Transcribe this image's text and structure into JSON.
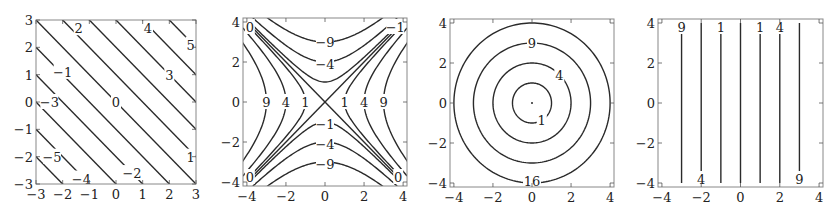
{
  "chart_data": [
    {
      "type": "contour",
      "id": "plot-1",
      "function": "x + y",
      "frame_px": [
        36,
        20,
        196,
        184
      ],
      "xlim": [
        -3,
        3
      ],
      "ylim": [
        -3,
        3
      ],
      "xticks": [
        -3,
        -2,
        -1,
        0,
        1,
        2,
        3
      ],
      "yticks": [
        -3,
        -2,
        -1,
        0,
        1,
        2,
        3
      ],
      "xtick_labels": [
        "−3",
        "−2",
        "−1",
        "0",
        "1",
        "2",
        "3"
      ],
      "ytick_labels": [
        "−3",
        "−2",
        "−1",
        "0",
        "1",
        "2",
        "3"
      ],
      "levels": [
        -5,
        -4,
        -3,
        -2,
        -1,
        0,
        1,
        2,
        3,
        4,
        5
      ],
      "contour_labels": [
        {
          "text": "2",
          "x": -1.4,
          "y": 2.7
        },
        {
          "text": "4",
          "x": 1.2,
          "y": 2.7
        },
        {
          "text": "5",
          "x": 2.8,
          "y": 2.1
        },
        {
          "text": "3",
          "x": 2.0,
          "y": 1.0
        },
        {
          "text": "−1",
          "x": -2.0,
          "y": 1.1
        },
        {
          "text": "−3",
          "x": -2.5,
          "y": 0.0
        },
        {
          "text": "0",
          "x": 0.0,
          "y": 0.0
        },
        {
          "text": "1",
          "x": 2.8,
          "y": -2.0
        },
        {
          "text": "−5",
          "x": -2.4,
          "y": -2.0
        },
        {
          "text": "−4",
          "x": -1.3,
          "y": -2.8
        },
        {
          "text": "−2",
          "x": 0.6,
          "y": -2.6
        }
      ],
      "grid": false
    },
    {
      "type": "contour",
      "id": "plot-2",
      "function": "x^2 - y^2",
      "frame_px": [
        243,
        18,
        407,
        186
      ],
      "xlim": [
        -4.2,
        4.2
      ],
      "ylim": [
        -4.2,
        4.2
      ],
      "xticks": [
        -4,
        -2,
        0,
        2,
        4
      ],
      "yticks": [
        -4,
        -2,
        0,
        2,
        4
      ],
      "xtick_labels": [
        "−4",
        "−2",
        "0",
        "2",
        "4"
      ],
      "ytick_labels": [
        "−4",
        "−2",
        "0",
        "2",
        "4"
      ],
      "levels": [
        -9,
        -4,
        -1,
        0,
        1,
        4,
        9
      ],
      "contour_labels": [
        {
          "text": "0",
          "x": -3.85,
          "y": 3.75
        },
        {
          "text": "−1",
          "x": 3.6,
          "y": 3.75
        },
        {
          "text": "−9",
          "x": 0.0,
          "y": 3.0
        },
        {
          "text": "−4",
          "x": 0.0,
          "y": 1.9
        },
        {
          "text": "9",
          "x": -3.0,
          "y": 0.0
        },
        {
          "text": "4",
          "x": -2.0,
          "y": 0.0
        },
        {
          "text": "1",
          "x": -1.0,
          "y": 0.0
        },
        {
          "text": "1",
          "x": 1.0,
          "y": 0.0
        },
        {
          "text": "4",
          "x": 2.0,
          "y": 0.0
        },
        {
          "text": "9",
          "x": 3.0,
          "y": 0.0
        },
        {
          "text": "−1",
          "x": 0.0,
          "y": -1.1
        },
        {
          "text": "−4",
          "x": 0.0,
          "y": -2.1
        },
        {
          "text": "−9",
          "x": 0.0,
          "y": -3.1
        },
        {
          "text": "0",
          "x": -3.85,
          "y": -3.75
        },
        {
          "text": "0",
          "x": 3.75,
          "y": -3.75
        }
      ],
      "grid": false
    },
    {
      "type": "contour",
      "id": "plot-3",
      "function": "x^2 + y^2",
      "frame_px": [
        450,
        19,
        614,
        187
      ],
      "xlim": [
        -4.2,
        4.2
      ],
      "ylim": [
        -4.2,
        4.2
      ],
      "xticks": [
        -4,
        -2,
        0,
        2,
        4
      ],
      "yticks": [
        -4,
        -2,
        0,
        2,
        4
      ],
      "xtick_labels": [
        "−4",
        "−2",
        "0",
        "2",
        "4"
      ],
      "ytick_labels": [
        "−4",
        "−2",
        "0",
        "2",
        "4"
      ],
      "levels": [
        0,
        1,
        4,
        9,
        16
      ],
      "contour_labels": [
        {
          "text": "9",
          "x": 0.0,
          "y": 3.0
        },
        {
          "text": "4",
          "x": 1.4,
          "y": 1.4
        },
        {
          "text": "1",
          "x": 0.5,
          "y": -0.85
        },
        {
          "text": "16",
          "x": 0.0,
          "y": -3.9
        }
      ],
      "grid": false
    },
    {
      "type": "contour",
      "id": "plot-4",
      "function": "x^2",
      "frame_px": [
        658,
        19,
        823,
        187
      ],
      "xlim": [
        -4.2,
        4.2
      ],
      "ylim": [
        -4.2,
        4.2
      ],
      "xticks": [
        -4,
        -2,
        0,
        2,
        4
      ],
      "yticks": [
        -4,
        -2,
        0,
        2,
        4
      ],
      "xtick_labels": [
        "−4",
        "−2",
        "0",
        "2",
        "4"
      ],
      "ytick_labels": [
        "−4",
        "−2",
        "0",
        "2",
        "4"
      ],
      "levels": [
        0,
        1,
        4,
        9
      ],
      "vertical_lines_x": [
        -3,
        -2,
        -1,
        0,
        1,
        2,
        3
      ],
      "contour_labels": [
        {
          "text": "9",
          "x": -3.0,
          "y": 3.8
        },
        {
          "text": "1",
          "x": -1.0,
          "y": 3.8
        },
        {
          "text": "1",
          "x": 1.0,
          "y": 3.8
        },
        {
          "text": "4",
          "x": 2.0,
          "y": 3.8
        },
        {
          "text": "4",
          "x": -2.0,
          "y": -3.8
        },
        {
          "text": "9",
          "x": 3.0,
          "y": -3.8
        }
      ],
      "grid": false
    }
  ],
  "style": {
    "line_color": "#2a2a2a",
    "frame_color": "#888888",
    "background": "#ffffff"
  }
}
